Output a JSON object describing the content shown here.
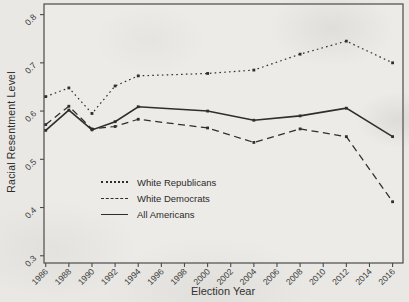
{
  "chart_data": {
    "type": "line",
    "title": "",
    "xlabel": "Election Year",
    "ylabel": "Racial Resentment Level",
    "x": [
      1986,
      1988,
      1990,
      1992,
      1994,
      2000,
      2004,
      2008,
      2012,
      2016
    ],
    "x_ticks": [
      1986,
      1988,
      1990,
      1992,
      1994,
      1996,
      1998,
      2000,
      2002,
      2004,
      2006,
      2008,
      2010,
      2012,
      2014,
      2016
    ],
    "y_ticks": [
      0.3,
      0.4,
      0.5,
      0.6,
      0.7,
      0.8
    ],
    "xlim": [
      1985.85,
      2016.9
    ],
    "ylim": [
      0.285,
      0.822
    ],
    "grid": false,
    "legend_position": "inside-bottom-left",
    "series": [
      {
        "name": "White Republicans",
        "style": "dotted",
        "values": [
          0.63,
          0.648,
          0.595,
          0.652,
          0.673,
          0.678,
          0.685,
          0.718,
          0.745,
          0.7
        ]
      },
      {
        "name": "White Democrats",
        "style": "dashed",
        "values": [
          0.572,
          0.61,
          0.563,
          0.568,
          0.583,
          0.565,
          0.535,
          0.563,
          0.547,
          0.412
        ]
      },
      {
        "name": "All Americans",
        "style": "solid",
        "values": [
          0.56,
          0.602,
          0.561,
          0.578,
          0.609,
          0.6,
          0.581,
          0.59,
          0.606,
          0.547
        ]
      }
    ],
    "colors": {
      "line": "#2e2e2c",
      "text": "#3a3a38",
      "axis": "#4a4a48",
      "background": "#e9e8e5",
      "plot_background": "#edebe8"
    }
  }
}
